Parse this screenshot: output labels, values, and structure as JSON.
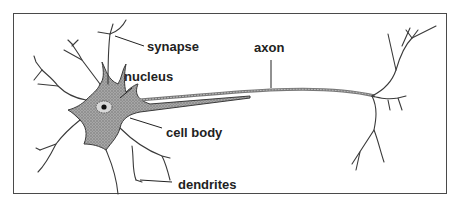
{
  "diagram": {
    "labels": {
      "synapse": "synapse",
      "nucleus": "nucleus",
      "cell_body": "cell body",
      "dendrites": "dendrites",
      "axon": "axon"
    },
    "colors": {
      "stroke": "#3a3a3a",
      "cell_fill": "#8c8c8c",
      "frame": "#4a4a4a",
      "text": "#222222"
    }
  }
}
